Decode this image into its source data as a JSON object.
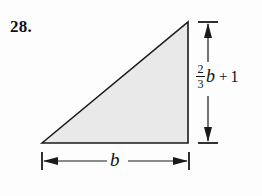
{
  "problem": {
    "number": "28."
  },
  "figure": {
    "shape_name": "right-triangle",
    "fill_color": "#e9e9e9",
    "stroke_color": "#1a1a1a",
    "background_color": "#fdfdfd"
  },
  "labels": {
    "height": {
      "fraction_numerator": "2",
      "fraction_denominator": "3",
      "variable": "b",
      "operator": "+",
      "constant": "1",
      "full_text": "2/3 b + 1"
    },
    "base": {
      "text": "b"
    }
  }
}
